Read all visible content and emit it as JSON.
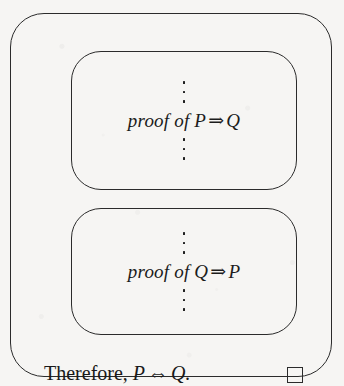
{
  "figure": {
    "kind": "proof-structure-diagram",
    "outer_box": {
      "label": "outer proof box"
    },
    "blocks": [
      {
        "dots_above": "⋮",
        "prefix": "proof of ",
        "antecedent": "P",
        "operator": "⇒",
        "consequent": "Q",
        "full_text": "proof of P ⇒ Q",
        "dots_below": "⋮"
      },
      {
        "dots_above": "⋮",
        "prefix": "proof of ",
        "antecedent": "Q",
        "operator": "⇒",
        "consequent": "P",
        "full_text": "proof of Q ⇒ P",
        "dots_below": "⋮"
      }
    ],
    "conclusion": {
      "lead": "Therefore, ",
      "left": "P",
      "operator": "⇔",
      "right": "Q",
      "terminator": ".",
      "full_text": "Therefore, P ⇔ Q."
    },
    "qed": {
      "symbol": "",
      "name": "qed-tombstone"
    },
    "colors": {
      "ink": "#2b2b2b",
      "text": "#1c1c1c",
      "paper": "#f6f5f3"
    }
  }
}
